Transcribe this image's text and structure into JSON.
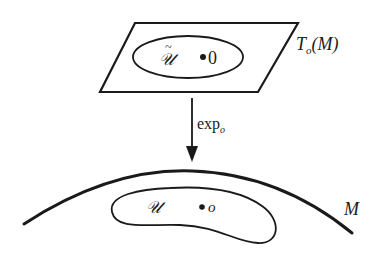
{
  "diagram": {
    "tangent_plane": {
      "label_main": "T",
      "label_sub": "o",
      "label_arg": "(M)",
      "region_label": "𝒰",
      "region_tilde": "~",
      "point_label": "0"
    },
    "map": {
      "label_main": "exp",
      "label_sub": "o"
    },
    "manifold": {
      "label": "M",
      "region_label": "𝒰",
      "point_label": "o"
    },
    "colors": {
      "ink": "#1a1a1a",
      "background": "#ffffff"
    }
  }
}
